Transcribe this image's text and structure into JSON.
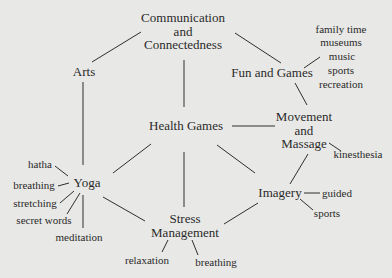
{
  "diagram": {
    "nodes": {
      "communication": {
        "lines": [
          "Communication",
          "and",
          "Connectedness"
        ]
      },
      "arts": {
        "label": "Arts"
      },
      "fun_games": {
        "label": "Fun and Games"
      },
      "health_games": {
        "label": "Health Games"
      },
      "movement": {
        "lines": [
          "Movement",
          "and",
          "Massage"
        ]
      },
      "yoga": {
        "label": "Yoga"
      },
      "imagery": {
        "label": "Imagery"
      },
      "stress": {
        "lines": [
          "Stress",
          "Management"
        ]
      }
    },
    "fun_games_items": [
      "family time",
      "museums",
      "music",
      "sports",
      "recreation"
    ],
    "movement_items": [
      "kinesthesia"
    ],
    "yoga_items": [
      "hatha",
      "breathing",
      "stretching",
      "secret words",
      "meditation"
    ],
    "imagery_items": [
      "guided",
      "sports"
    ],
    "stress_items": [
      "relaxation",
      "breathing"
    ],
    "colors": {
      "background": "#e8e8e6",
      "text": "#2a2a2a",
      "lines": "#2e2e2e"
    }
  }
}
